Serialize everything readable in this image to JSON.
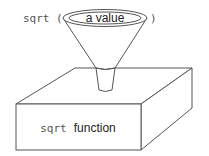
{
  "diagram": {
    "call_prefix": "sqrt (",
    "call_suffix": ")",
    "input_label": "a value",
    "box_label_code": "sqrt",
    "box_label_text": "function"
  },
  "colors": {
    "stroke": "#555555",
    "text": "#222222",
    "background": "#ffffff"
  }
}
